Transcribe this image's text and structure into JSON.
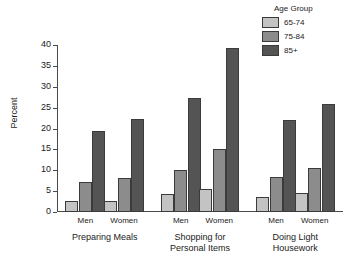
{
  "chart_data": {
    "type": "bar",
    "title": "",
    "xlabel": "",
    "ylabel": "Percent",
    "ylim": [
      0,
      40
    ],
    "yticks": [
      0,
      5,
      10,
      15,
      20,
      25,
      30,
      35,
      40
    ],
    "grid": false,
    "legend": {
      "title": "Age Group",
      "position": "top-right",
      "entries": [
        {
          "name": "65-74",
          "color": "#c3c3c3"
        },
        {
          "name": "75-84",
          "color": "#8c8c8c"
        },
        {
          "name": "85+",
          "color": "#545454"
        }
      ]
    },
    "groups": [
      {
        "label": "Preparing Meals",
        "subgroups": [
          {
            "label": "Men",
            "values": [
              2.6,
              7.2,
              19.4
            ]
          },
          {
            "label": "Women",
            "values": [
              2.7,
              8.2,
              22.2
            ]
          }
        ]
      },
      {
        "label": "Shopping for\nPersonal Items",
        "label_lines": [
          "Shopping for",
          "Personal Items"
        ],
        "subgroups": [
          {
            "label": "Men",
            "values": [
              4.4,
              10.0,
              27.3
            ]
          },
          {
            "label": "Women",
            "values": [
              5.6,
              15.0,
              39.2
            ]
          }
        ]
      },
      {
        "label": "Doing Light\nHousework",
        "label_lines": [
          "Doing Light",
          "Housework"
        ],
        "subgroups": [
          {
            "label": "Men",
            "values": [
              3.5,
              8.3,
              22.0
            ]
          },
          {
            "label": "Women",
            "values": [
              4.5,
              10.6,
              25.9
            ]
          }
        ]
      }
    ],
    "series": [
      {
        "name": "65-74",
        "values": [
          2.6,
          2.7,
          4.4,
          5.6,
          3.5,
          4.5
        ]
      },
      {
        "name": "75-84",
        "values": [
          7.2,
          8.2,
          10.0,
          15.0,
          8.3,
          10.6
        ]
      },
      {
        "name": "85+",
        "values": [
          19.4,
          22.2,
          27.3,
          39.2,
          22.0,
          25.9
        ]
      }
    ],
    "categories": [
      "Preparing Meals - Men",
      "Preparing Meals - Women",
      "Shopping for Personal Items - Men",
      "Shopping for Personal Items - Women",
      "Doing Light Housework - Men",
      "Doing Light Housework - Women"
    ]
  }
}
